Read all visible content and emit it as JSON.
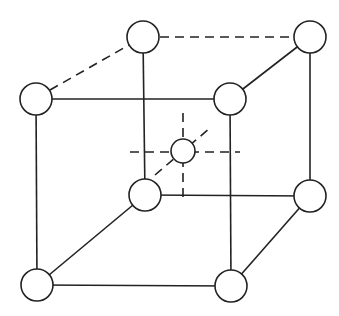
{
  "diagram": {
    "type": "body-centered cubic unit cell",
    "colors": {
      "line": "#222222",
      "atom_fill": "#ffffff",
      "background": "#ffffff"
    },
    "atoms": [
      {
        "id": "top-back-left",
        "cx": 143,
        "cy": 37,
        "r": 16
      },
      {
        "id": "top-back-right",
        "cx": 310,
        "cy": 37,
        "r": 16
      },
      {
        "id": "top-front-left",
        "cx": 36,
        "cy": 99,
        "r": 16
      },
      {
        "id": "top-front-right",
        "cx": 230,
        "cy": 99,
        "r": 16
      },
      {
        "id": "body-center",
        "cx": 183,
        "cy": 151,
        "r": 12
      },
      {
        "id": "bottom-back-left",
        "cx": 145,
        "cy": 195,
        "r": 16
      },
      {
        "id": "bottom-back-right",
        "cx": 310,
        "cy": 196,
        "r": 16
      },
      {
        "id": "bottom-front-left",
        "cx": 37,
        "cy": 285,
        "r": 16
      },
      {
        "id": "bottom-front-right",
        "cx": 231,
        "cy": 286,
        "r": 16
      }
    ]
  }
}
